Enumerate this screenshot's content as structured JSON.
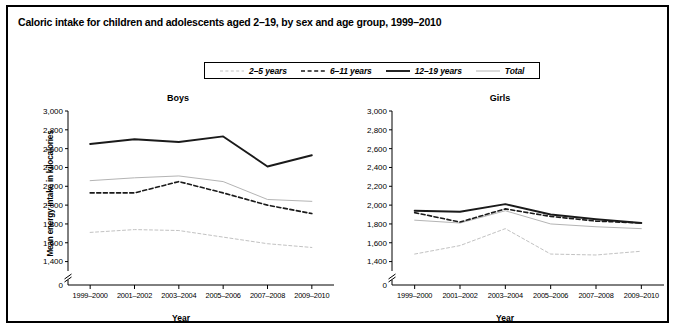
{
  "figure": {
    "title": "Caloric intake for children and adolescents aged 2–19, by sex and age group, 1999–2010",
    "source_note": "SOURCE: National Center for Health Statistics, National Health and Nutrition Examination Survey."
  },
  "legend": {
    "entries": [
      {
        "label": "2–5 years",
        "style": "fine-dashed",
        "color": "#c9c9c9"
      },
      {
        "label": "6–11 years",
        "style": "bold-dashed",
        "color": "#1a1a1a"
      },
      {
        "label": "12–19 years",
        "style": "thick-solid",
        "color": "#1a1a1a"
      },
      {
        "label": "Total",
        "style": "thin-solid",
        "color": "#b4b4b4"
      }
    ]
  },
  "chart_data": [
    {
      "type": "line",
      "title": "Boys",
      "xlabel": "Year",
      "ylabel": "Mean energy intake in kilocalories",
      "categories": [
        "1999–2000",
        "2001–2002",
        "2003–2004",
        "2005–2006",
        "2007–2008",
        "2009–2010"
      ],
      "yticks": [
        0,
        1400,
        1600,
        1800,
        2000,
        2200,
        2400,
        2600,
        2800,
        3000
      ],
      "ytick_labels": [
        "0",
        "1,400",
        "1,600",
        "1,800",
        "2,000",
        "2,200",
        "2,400",
        "2,600",
        "2,800",
        "3,000"
      ],
      "ylim": [
        1300,
        3000
      ],
      "axis_break": true,
      "grid": false,
      "legend_position": "top-center-shared",
      "series": [
        {
          "name": "2–5 years",
          "values": [
            1710,
            1740,
            1730,
            1660,
            1590,
            1550
          ]
        },
        {
          "name": "6–11 years",
          "values": [
            2130,
            2130,
            2250,
            2130,
            2000,
            1910
          ]
        },
        {
          "name": "12–19 years",
          "values": [
            2650,
            2700,
            2670,
            2730,
            2410,
            2530
          ]
        },
        {
          "name": "Total",
          "values": [
            2260,
            2290,
            2310,
            2250,
            2060,
            2040
          ]
        }
      ]
    },
    {
      "type": "line",
      "title": "Girls",
      "xlabel": "Year",
      "ylabel": "Mean energy intake in kilocalories",
      "categories": [
        "1999–2000",
        "2001–2002",
        "2003–2004",
        "2005–2006",
        "2007–2008",
        "2009–2010"
      ],
      "yticks": [
        0,
        1400,
        1600,
        1800,
        2000,
        2200,
        2400,
        2600,
        2800,
        3000
      ],
      "ytick_labels": [
        "0",
        "1,400",
        "1,600",
        "1,800",
        "2,000",
        "2,200",
        "2,400",
        "2,600",
        "2,800",
        "3,000"
      ],
      "ylim": [
        1300,
        3000
      ],
      "axis_break": true,
      "grid": false,
      "legend_position": "top-center-shared",
      "series": [
        {
          "name": "2–5 years",
          "values": [
            1480,
            1570,
            1750,
            1480,
            1470,
            1510
          ]
        },
        {
          "name": "6–11 years",
          "values": [
            1920,
            1820,
            1960,
            1880,
            1830,
            1810
          ]
        },
        {
          "name": "12–19 years",
          "values": [
            1940,
            1930,
            2010,
            1900,
            1850,
            1810
          ]
        },
        {
          "name": "Total",
          "values": [
            1840,
            1810,
            1940,
            1800,
            1770,
            1750
          ]
        }
      ]
    }
  ]
}
